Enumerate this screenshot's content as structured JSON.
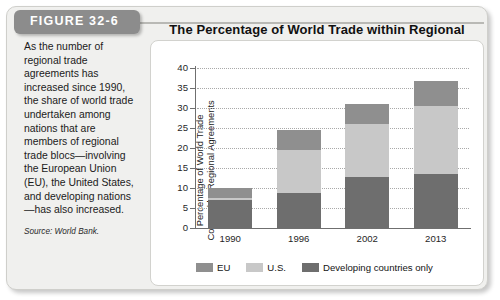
{
  "figure": {
    "tag": "FIGURE 32-6",
    "caption": "As the number of regional trade agreements has increased since 1990, the share of world trade undertaken among nations that are members of regional trade blocs—involving the European Union (EU), the United States, and developing nations—has also increased.",
    "source": "Source: World Bank."
  },
  "chart_data": {
    "type": "bar",
    "stacked": true,
    "title": "The Percentage of World Trade within Regional Trade Blocs",
    "xlabel": "",
    "ylabel": "Percentage of World Trade Covered by Regional Agreements",
    "ylabel_line1": "Percentage of World Trade",
    "ylabel_line2": "Covered by Regional Agreements",
    "categories": [
      "1990",
      "1996",
      "2002",
      "2013"
    ],
    "ylim": [
      0,
      40
    ],
    "yticks": [
      0,
      5,
      10,
      15,
      20,
      25,
      30,
      35,
      40
    ],
    "grid": true,
    "legend_position": "bottom",
    "series": [
      {
        "name": "Developing countries only",
        "color": "#6e6e6e",
        "values": [
          7.0,
          8.7,
          12.7,
          13.6
        ]
      },
      {
        "name": "U.S.",
        "color": "#c8c8c8",
        "values": [
          0.4,
          10.7,
          13.3,
          17.0
        ]
      },
      {
        "name": "EU",
        "color": "#8f8f8f",
        "values": [
          2.6,
          5.1,
          5.1,
          6.2
        ]
      }
    ],
    "totals": [
      10.0,
      24.5,
      31.1,
      36.8
    ]
  },
  "legend": {
    "items": [
      {
        "label": "EU",
        "color": "#8f8f8f"
      },
      {
        "label": "U.S.",
        "color": "#c8c8c8"
      },
      {
        "label": "Developing countries only",
        "color": "#6e6e6e"
      }
    ]
  }
}
